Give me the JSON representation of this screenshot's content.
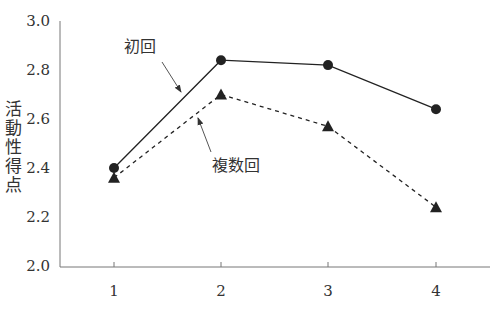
{
  "chart_data": {
    "type": "line",
    "title": "",
    "xlabel": "",
    "ylabel": "活動性得点",
    "x": [
      1,
      2,
      3,
      4
    ],
    "categories": [
      "1",
      "2",
      "3",
      "4"
    ],
    "ylim": [
      2.0,
      3.0
    ],
    "yticks": [
      "2.0",
      "2.2",
      "2.4",
      "2.6",
      "2.8",
      "3.0"
    ],
    "grid": false,
    "legend": "inline-annotations",
    "series": [
      {
        "name": "初回",
        "values": [
          2.4,
          2.84,
          2.82,
          2.64
        ],
        "marker": "circle",
        "line": "solid"
      },
      {
        "name": "複数回",
        "values": [
          2.36,
          2.7,
          2.57,
          2.24
        ],
        "marker": "triangle",
        "line": "dashed"
      }
    ],
    "annotations": [
      {
        "text": "初回",
        "target_series": "初回"
      },
      {
        "text": "複数回",
        "target_series": "複数回"
      }
    ]
  },
  "labels": {
    "ylabel": "活動性得点",
    "series_a": "初回",
    "series_b": "複数回"
  },
  "colors": {
    "line": "#222222",
    "axis": "#777777",
    "text": "#333333"
  }
}
